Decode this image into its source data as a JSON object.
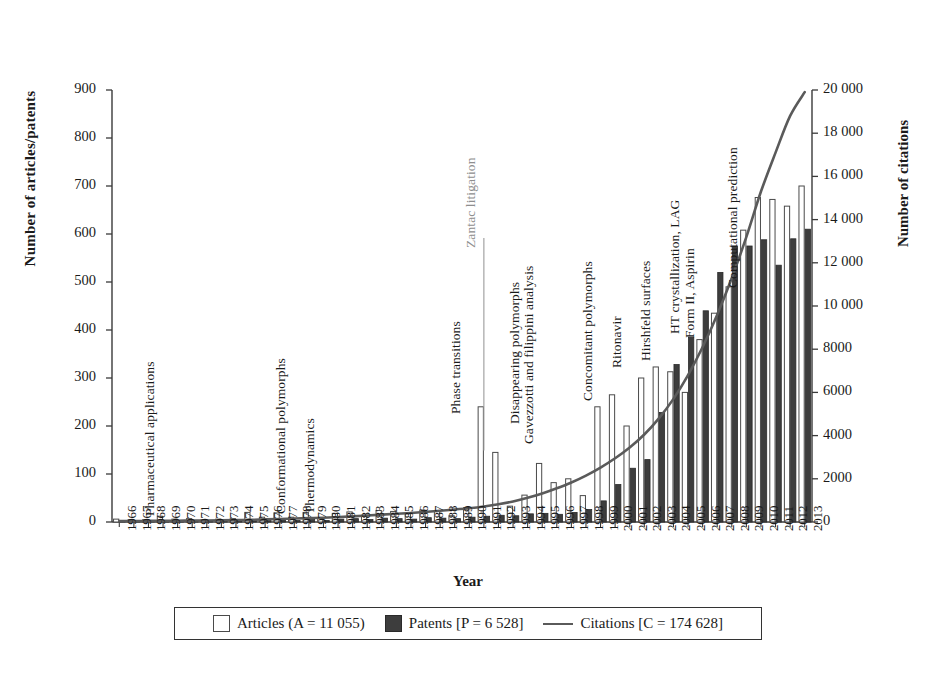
{
  "chart_data": {
    "type": "bar",
    "title": "",
    "xlabel": "Year",
    "ylabel": "Number of articles/patents",
    "ylabel_right": "Number of citations",
    "ylim": [
      0,
      900
    ],
    "ylim_right": [
      0,
      20000
    ],
    "yticks": [
      "0",
      "100",
      "200",
      "300",
      "400",
      "500",
      "600",
      "700",
      "800",
      "900"
    ],
    "yticks_right": [
      "0",
      "2000",
      "4000",
      "6000",
      "8000",
      "10 000",
      "12 000",
      "14 000",
      "16 000",
      "18 000",
      "20 000"
    ],
    "grid": false,
    "legend_position": "bottom",
    "categories": [
      "1966",
      "1967",
      "1968",
      "1969",
      "1970",
      "1971",
      "1972",
      "1973",
      "1974",
      "1975",
      "1976",
      "1977",
      "1978",
      "1979",
      "1980",
      "1981",
      "1982",
      "1983",
      "1984",
      "1985",
      "1986",
      "1987",
      "1988",
      "1989",
      "1990",
      "1991",
      "1992",
      "1993",
      "1994",
      "1995",
      "1996",
      "1997",
      "1998",
      "1999",
      "2000",
      "2001",
      "2002",
      "2003",
      "2004",
      "2005",
      "2006",
      "2007",
      "2008",
      "2009",
      "2010",
      "2011",
      "2012",
      "2013"
    ],
    "series": [
      {
        "name": "Articles (A = 11 055)",
        "key": "articles",
        "axis": "left",
        "type": "bar",
        "color": "#ffffff",
        "edge": "#4a4a4a",
        "values": [
          6,
          5,
          5,
          12,
          6,
          7,
          5,
          6,
          7,
          20,
          10,
          19,
          10,
          20,
          7,
          18,
          21,
          14,
          24,
          22,
          18,
          25,
          23,
          13,
          30,
          240,
          145,
          33,
          56,
          122,
          82,
          90,
          55,
          240,
          265,
          200,
          300,
          323,
          313,
          270,
          380,
          435,
          490,
          608,
          676,
          672,
          658,
          700
        ]
      },
      {
        "name": "Patents [P = 6 528]",
        "key": "patents",
        "axis": "left",
        "type": "bar",
        "color": "#3d3d3d",
        "edge": "#2a2a2a",
        "values": [
          2,
          2,
          2,
          3,
          2,
          3,
          2,
          3,
          3,
          4,
          3,
          4,
          3,
          5,
          3,
          6,
          7,
          5,
          8,
          7,
          6,
          9,
          8,
          7,
          10,
          12,
          14,
          13,
          17,
          18,
          16,
          20,
          26,
          44,
          78,
          112,
          130,
          228,
          328,
          385,
          440,
          520,
          575,
          575,
          588,
          535,
          590,
          610
        ]
      },
      {
        "name": "Citations [C = 174 628]",
        "key": "citations",
        "axis": "right",
        "type": "line",
        "color": "#5a5a5a",
        "values": [
          40,
          45,
          50,
          55,
          60,
          65,
          70,
          80,
          90,
          100,
          120,
          140,
          160,
          180,
          200,
          230,
          260,
          300,
          340,
          380,
          420,
          470,
          520,
          580,
          640,
          720,
          820,
          950,
          1120,
          1320,
          1560,
          1830,
          2150,
          2520,
          2950,
          3450,
          4050,
          4800,
          5700,
          6800,
          8100,
          9600,
          11300,
          13200,
          15300,
          17100,
          18800,
          19900
        ]
      }
    ],
    "annotations": [
      {
        "text": "Pharmaceutical applications",
        "year": "1969",
        "color": "dark",
        "leader": false
      },
      {
        "text": "Conformational polymorphs",
        "year": "1978",
        "color": "dark",
        "leader": false
      },
      {
        "text": "Thermodynamics",
        "year": "1980",
        "color": "dark",
        "leader": false
      },
      {
        "text": "Phase transitions",
        "year": "1990",
        "color": "dark",
        "leader": false
      },
      {
        "text": "Zantac litigation",
        "year": "1991",
        "color": "gray",
        "leader": true
      },
      {
        "text": "Disappearing polymorphs",
        "year": "1994",
        "color": "dark",
        "leader": false
      },
      {
        "text": "Gavezzotti and filippini analysis",
        "year": "1995",
        "color": "dark",
        "leader": false
      },
      {
        "text": "Concomitant polymorphs",
        "year": "1999",
        "color": "dark",
        "leader": false
      },
      {
        "text": "Ritonavir",
        "year": "2001",
        "color": "dark",
        "leader": false
      },
      {
        "text": "Hirshfeld surfaces",
        "year": "2003",
        "color": "dark",
        "leader": false
      },
      {
        "text": "HT crystallization, LAG",
        "year": "2005",
        "color": "dark",
        "leader": false
      },
      {
        "text": "Form II, Aspirin",
        "year": "2006",
        "color": "dark",
        "leader": false
      },
      {
        "text": "Computational prediction",
        "year": "2009",
        "color": "dark",
        "leader": false
      }
    ]
  },
  "axes": {
    "left_title": "Number of articles/patents",
    "right_title": "Number of citations",
    "x_title": "Year"
  },
  "legend": {
    "articles_label": "Articles (A = 11 055)",
    "patents_label": "Patents [P = 6 528]",
    "citations_label": "Citations [C = 174 628]"
  }
}
